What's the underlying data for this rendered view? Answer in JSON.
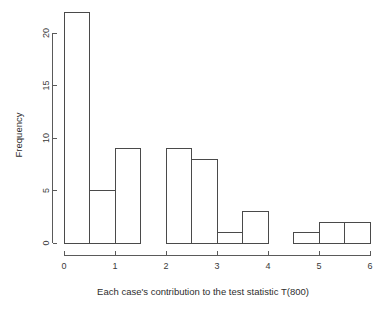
{
  "chart_data": {
    "type": "bar",
    "chart_subtype": "histogram",
    "title": "",
    "subtitle": "",
    "xlabel": "Each case's contribution to the test statistic T(800)",
    "ylabel": "Frequency",
    "xlim": [
      0,
      6
    ],
    "ylim": [
      0,
      22
    ],
    "grid": false,
    "legend": false,
    "legend_position": "none",
    "bin_width": 0.5,
    "bin_edges": [
      0,
      0.5,
      1,
      1.5,
      2,
      2.5,
      3,
      3.5,
      4,
      4.5,
      5,
      5.5,
      6
    ],
    "categories": [
      "0-0.5",
      "0.5-1",
      "1-1.5",
      "1.5-2",
      "2-2.5",
      "2.5-3",
      "3-3.5",
      "3.5-4",
      "4-4.5",
      "4.5-5",
      "5-5.5",
      "5.5-6"
    ],
    "values": [
      22,
      5,
      9,
      0,
      9,
      8,
      1,
      3,
      0,
      1,
      2,
      2
    ],
    "bars": [
      {
        "x0": 0,
        "x1": 0.5,
        "frequency": 22
      },
      {
        "x0": 0.5,
        "x1": 1,
        "frequency": 5
      },
      {
        "x0": 1,
        "x1": 1.5,
        "frequency": 9
      },
      {
        "x0": 1.5,
        "x1": 2,
        "frequency": 0
      },
      {
        "x0": 2,
        "x1": 2.5,
        "frequency": 9
      },
      {
        "x0": 2.5,
        "x1": 3,
        "frequency": 8
      },
      {
        "x0": 3,
        "x1": 3.5,
        "frequency": 1
      },
      {
        "x0": 3.5,
        "x1": 4,
        "frequency": 3
      },
      {
        "x0": 4,
        "x1": 4.5,
        "frequency": 0
      },
      {
        "x0": 4.5,
        "x1": 5,
        "frequency": 1
      },
      {
        "x0": 5,
        "x1": 5.5,
        "frequency": 2
      },
      {
        "x0": 5.5,
        "x1": 6,
        "frequency": 2
      }
    ],
    "x_ticks": [
      0,
      1,
      2,
      3,
      4,
      5,
      6
    ],
    "x_tick_labels": [
      "0",
      "1",
      "2",
      "3",
      "4",
      "5",
      "6"
    ],
    "y_ticks": [
      0,
      5,
      10,
      15,
      20
    ],
    "y_tick_labels": [
      "0",
      "5",
      "10",
      "15",
      "20"
    ],
    "colors": {
      "background": "#ffffff",
      "bar_fill": "none",
      "bar_stroke": "#4a4a4a",
      "axis": "#5a5a5a",
      "text": "#3a3a3a"
    }
  }
}
